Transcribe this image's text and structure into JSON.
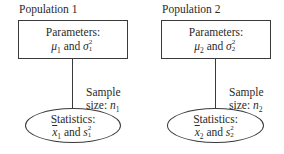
{
  "diagram": {
    "populations": [
      {
        "title": "Population 1",
        "parameters_label": "Parameters:",
        "parameters": {
          "mean_symbol": "μ",
          "index": "1",
          "conj": "and",
          "var_symbol": "σ",
          "var_exp": "2"
        },
        "sample_label": "Sample",
        "sample_size_label": "size:",
        "sample_size_symbol": "n",
        "statistics_label": "Statistics:",
        "statistics": {
          "mean_symbol": "x",
          "index": "1",
          "conj": "and",
          "var_symbol": "s",
          "var_exp": "2"
        }
      },
      {
        "title": "Population 2",
        "parameters_label": "Parameters:",
        "parameters": {
          "mean_symbol": "μ",
          "index": "2",
          "conj": "and",
          "var_symbol": "σ",
          "var_exp": "2"
        },
        "sample_label": "Sample",
        "sample_size_label": "size:",
        "sample_size_symbol": "n",
        "statistics_label": "Statistics:",
        "statistics": {
          "mean_symbol": "x",
          "index": "2",
          "conj": "and",
          "var_symbol": "s",
          "var_exp": "2"
        }
      }
    ],
    "colors": {
      "stroke": "#3a3a3a",
      "text": "#2a2a2a",
      "background": "#ffffff"
    }
  }
}
